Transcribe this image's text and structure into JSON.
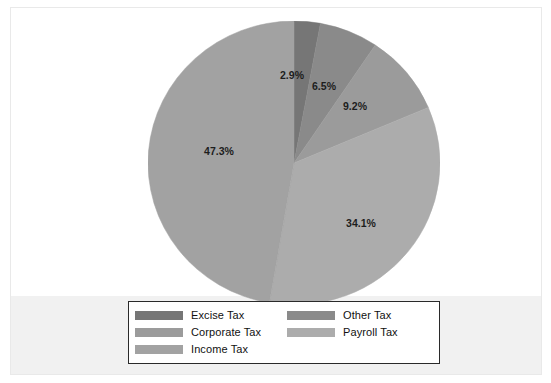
{
  "chart_data": {
    "type": "pie",
    "title": "",
    "subtitle": "",
    "xlabel": "",
    "ylabel": "",
    "start_angle_deg": 0,
    "direction": "clockwise",
    "grid": false,
    "legend_position": "bottom",
    "categories": [
      "Excise Tax",
      "Other Tax",
      "Corporate Tax",
      "Payroll Tax",
      "Income Tax"
    ],
    "values": [
      2.9,
      6.5,
      9.2,
      34.1,
      47.3
    ],
    "labels": [
      "2.9%",
      "6.5%",
      "9.2%",
      "34.1%",
      "47.3%"
    ],
    "colors": [
      "#767676",
      "#8a8a8a",
      "#9b9b9b",
      "#acacac",
      "#a2a2a2"
    ],
    "slices": [
      {
        "name": "Excise Tax",
        "value": 2.9,
        "label": "2.9%",
        "color": "#767676",
        "label_x": 144,
        "label_y": 55
      },
      {
        "name": "Other Tax",
        "value": 6.5,
        "label": "6.5%",
        "color": "#8a8a8a",
        "label_x": 176,
        "label_y": 66
      },
      {
        "name": "Corporate Tax",
        "value": 9.2,
        "label": "9.2%",
        "color": "#9b9b9b",
        "label_x": 207,
        "label_y": 86
      },
      {
        "name": "Payroll Tax",
        "value": 34.1,
        "label": "34.1%",
        "color": "#acacac",
        "label_x": 213,
        "label_y": 203
      },
      {
        "name": "Income Tax",
        "value": 47.3,
        "label": "47.3%",
        "color": "#a2a2a2",
        "label_x": 71,
        "label_y": 131
      }
    ]
  },
  "legend": {
    "entries": [
      {
        "label": "Excise Tax",
        "color": "#767676"
      },
      {
        "label": "Other Tax",
        "color": "#8a8a8a"
      },
      {
        "label": "Corporate Tax",
        "color": "#9b9b9b"
      },
      {
        "label": "Payroll Tax",
        "color": "#acacac"
      },
      {
        "label": "Income Tax",
        "color": "#a2a2a2"
      }
    ]
  },
  "colors": {
    "background": "#ffffff",
    "lower_band": "#f1f1f1",
    "frame_border": "#e9e9e9",
    "legend_border": "#2a2a2a",
    "text": "#111111"
  }
}
